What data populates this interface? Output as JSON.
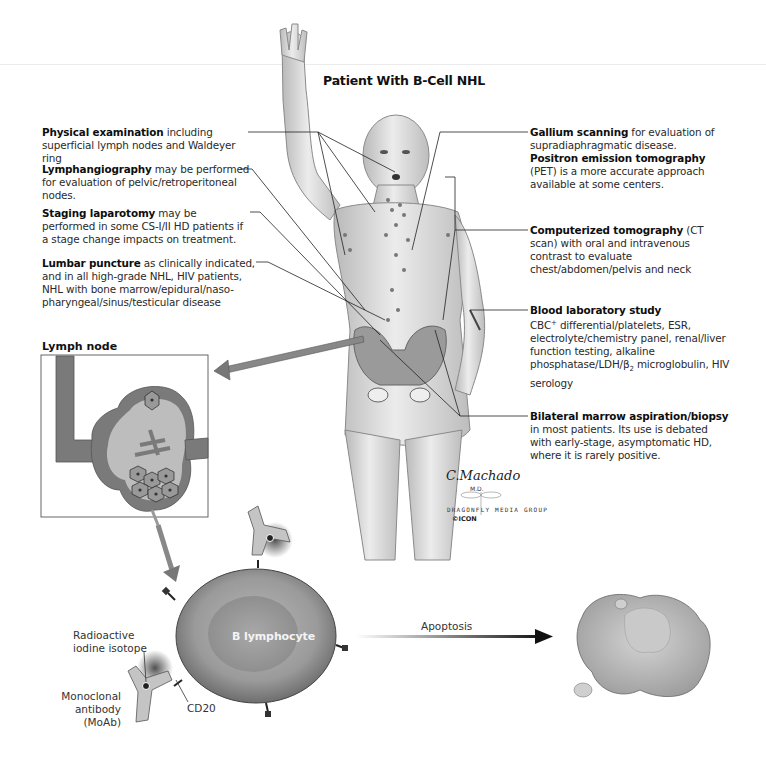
{
  "title": "Patient With B-Cell NHL",
  "left_annotations": [
    {
      "bold": "Physical examination",
      "text": " including superficial lymph nodes and Waldeyer ring"
    },
    {
      "bold": "Lymphangiography",
      "text": " may be performed for evaluation of pelvic/retroperitoneal nodes."
    },
    {
      "bold": "Staging laparotomy",
      "text": " may be performed in some CS-I/II HD patients if a stage change impacts on treatment."
    },
    {
      "bold": "Lumbar puncture",
      "text": " as clinically indicated, and in all high-grade NHL, HIV patients, NHL with bone marrow/epidural/naso-pharyngeal/sinus/testicular disease"
    }
  ],
  "right_annotations": {
    "gallium": {
      "bold1": "Gallium scanning",
      "text1": " for evaluation of supradiaphragmatic disease. ",
      "bold2": "Positron emission tomography",
      "text2": " (PET) is a more accurate approach available at some centers."
    },
    "ct": {
      "bold": "Computerized tomography",
      "text": " (CT scan) with oral and intravenous contrast to evaluate chest/abdomen/pelvis and neck"
    },
    "blood": {
      "bold": "Blood laboratory study",
      "line1_pre": "CBC",
      "line1_sup": "+",
      "line1_post": " differential/platelets, ESR, electrolyte/chemistry panel, renal/liver function testing, alkaline phosphatase/LDH/β",
      "sub": "2",
      "line_end": " microglobulin, HIV serology"
    },
    "marrow": {
      "bold": "Bilateral marrow aspiration/biopsy",
      "text": " in most patients. Its use is debated with early-stage, asymptomatic HD, where it is rarely positive."
    }
  },
  "lymph_node": {
    "title": "Lymph node"
  },
  "cell": {
    "label": "B lymphocyte",
    "radioactive_label_1": "Radioactive",
    "radioactive_label_2": "iodine isotope",
    "moab_label_1": "Monoclonal",
    "moab_label_2": "antibody (MoAb)",
    "cd20_label": "CD20"
  },
  "apoptosis_label": "Apoptosis",
  "credits": {
    "signature": "C.Machado",
    "md": "M.D.",
    "publisher": "DRAGONFLY MEDIA GROUP",
    "logo": "©ICON"
  },
  "colors": {
    "skin_light": "#e6e6e6",
    "skin_shade": "#b5b5b5",
    "cell_outer": "#8f8f8f",
    "cell_inner": "#a9a9a9",
    "node_dark": "#7a7a7a",
    "node_light": "#bdbdbd"
  }
}
